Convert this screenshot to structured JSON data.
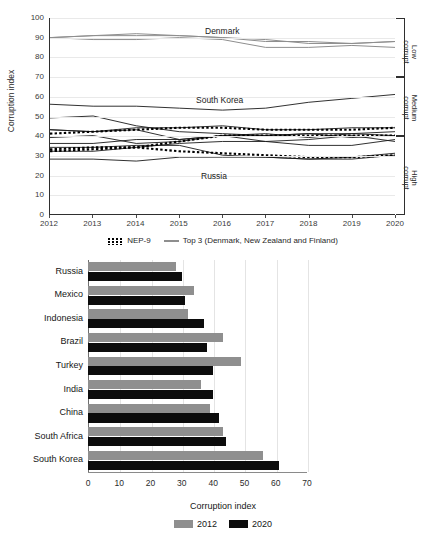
{
  "line_chart_labels": {
    "ylabel": "Corruption index",
    "annotations": [
      {
        "name": "denmark",
        "text": "Denmark"
      },
      {
        "name": "south-korea",
        "text": "South Korea"
      },
      {
        "name": "russia",
        "text": "Russia"
      }
    ],
    "brackets": [
      {
        "name": "low-corrupt",
        "text": "Low\ncorrupt"
      },
      {
        "name": "medium-corrupt",
        "text": "Medium\ncorrupt"
      },
      {
        "name": "high-corrupt",
        "text": "High\ncorrupt"
      }
    ],
    "legend": [
      {
        "name": "nep-9",
        "label": "NEP-9",
        "style": "dotted",
        "color": "#000000"
      },
      {
        "name": "top-3",
        "label": "Top 3 (Denmark, New Zealand and Finland)",
        "style": "solid",
        "color": "#8e8e8e"
      }
    ]
  },
  "bracket_low": "Low corrupt",
  "bracket_medium": "Medium corrupt",
  "bracket_high": "High corrupt",
  "chart_data": [
    {
      "type": "line",
      "title": "",
      "xlabel": "",
      "ylabel": "Corruption index",
      "x": [
        2012,
        2013,
        2014,
        2015,
        2016,
        2017,
        2018,
        2019,
        2020
      ],
      "xlim": [
        2012,
        2020
      ],
      "ylim": [
        0,
        100
      ],
      "yticks": [
        0,
        10,
        20,
        30,
        40,
        50,
        60,
        70,
        80,
        90,
        100
      ],
      "grid": true,
      "legend_position": "bottom",
      "annotations": [
        "Denmark",
        "South Korea",
        "Russia"
      ],
      "right_axis_bands": [
        {
          "label": "Low corrupt",
          "range": [
            70,
            100
          ]
        },
        {
          "label": "Medium corrupt",
          "range": [
            40,
            70
          ]
        },
        {
          "label": "High corrupt",
          "range": [
            0,
            40
          ]
        }
      ],
      "series": [
        {
          "name": "Denmark",
          "style": "solid",
          "color": "#8e8e8e",
          "group": "Top 3",
          "values": [
            90,
            91,
            92,
            91,
            90,
            88,
            88,
            87,
            88
          ]
        },
        {
          "name": "New Zealand",
          "style": "solid",
          "color": "#8e8e8e",
          "group": "Top 3",
          "values": [
            90,
            91,
            91,
            91,
            90,
            89,
            87,
            87,
            88
          ]
        },
        {
          "name": "Finland",
          "style": "solid",
          "color": "#8e8e8e",
          "group": "Top 3",
          "values": [
            90,
            89,
            89,
            90,
            89,
            85,
            85,
            86,
            85
          ]
        },
        {
          "name": "South Korea",
          "style": "solid",
          "color": "#1a1a1a",
          "group": "NEP-9",
          "values": [
            56,
            55,
            55,
            54,
            53,
            54,
            57,
            59,
            61
          ]
        },
        {
          "name": "Turkey",
          "style": "solid",
          "color": "#1a1a1a",
          "group": "NEP-9",
          "values": [
            49,
            50,
            45,
            42,
            41,
            40,
            41,
            39,
            40
          ]
        },
        {
          "name": "South Africa",
          "style": "solid",
          "color": "#1a1a1a",
          "group": "NEP-9",
          "values": [
            43,
            42,
            44,
            44,
            45,
            43,
            43,
            44,
            44
          ]
        },
        {
          "name": "Brazil",
          "style": "solid",
          "color": "#1a1a1a",
          "group": "NEP-9",
          "values": [
            43,
            42,
            43,
            38,
            40,
            37,
            35,
            35,
            38
          ]
        },
        {
          "name": "China",
          "style": "solid",
          "color": "#1a1a1a",
          "group": "NEP-9",
          "values": [
            39,
            40,
            36,
            37,
            40,
            41,
            39,
            41,
            42
          ]
        },
        {
          "name": "India",
          "style": "solid",
          "color": "#1a1a1a",
          "group": "NEP-9",
          "values": [
            36,
            36,
            38,
            38,
            40,
            40,
            41,
            41,
            40
          ]
        },
        {
          "name": "Mexico",
          "style": "solid",
          "color": "#1a1a1a",
          "group": "NEP-9",
          "values": [
            34,
            34,
            35,
            35,
            30,
            29,
            28,
            29,
            31
          ]
        },
        {
          "name": "Indonesia",
          "style": "solid",
          "color": "#1a1a1a",
          "group": "NEP-9",
          "values": [
            32,
            32,
            34,
            36,
            37,
            37,
            38,
            40,
            37
          ]
        },
        {
          "name": "Russia",
          "style": "solid",
          "color": "#1a1a1a",
          "group": "NEP-9",
          "values": [
            28,
            28,
            27,
            29,
            29,
            29,
            28,
            28,
            30
          ]
        },
        {
          "name": "NEP-9 upper average",
          "style": "dotted",
          "color": "#000000",
          "group": "NEP-9",
          "values": [
            41,
            42,
            43,
            44,
            44,
            43,
            43,
            43,
            44
          ]
        },
        {
          "name": "NEP-9 average",
          "style": "dotted",
          "color": "#000000",
          "group": "NEP-9",
          "values": [
            33,
            34,
            34,
            37,
            40,
            40,
            40,
            40,
            40
          ]
        },
        {
          "name": "NEP-9 lower average",
          "style": "dotted",
          "color": "#000000",
          "group": "NEP-9",
          "values": [
            32,
            33,
            34,
            32,
            31,
            30,
            29,
            29,
            30
          ]
        }
      ]
    },
    {
      "type": "bar",
      "orientation": "horizontal",
      "title": "",
      "xlabel": "Corruption index",
      "ylabel": "",
      "xlim": [
        0,
        70
      ],
      "xticks": [
        0,
        10,
        20,
        30,
        40,
        50,
        60,
        70
      ],
      "grid": true,
      "legend_position": "bottom",
      "categories": [
        "Russia",
        "Mexico",
        "Indonesia",
        "Brazil",
        "Turkey",
        "India",
        "China",
        "South Africa",
        "South Korea"
      ],
      "series": [
        {
          "name": "2012",
          "color": "#8f8f8f",
          "values": [
            28,
            34,
            32,
            43,
            49,
            36,
            39,
            43,
            56
          ]
        },
        {
          "name": "2020",
          "color": "#0c0c0c",
          "values": [
            30,
            31,
            37,
            38,
            40,
            40,
            42,
            44,
            61
          ]
        }
      ]
    }
  ]
}
